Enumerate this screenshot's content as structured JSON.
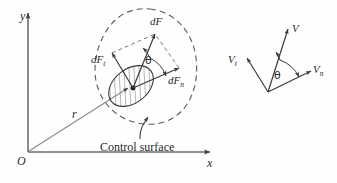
{
  "figure": {
    "name": "control-surface-force-and-velocity-decomposition",
    "background_color": "#fefefe",
    "ink_color": "#3a3a3a",
    "text_color": "#2b2b2b"
  },
  "axes": {
    "y_label": "y",
    "x_label": "x",
    "origin_label": "O",
    "position_vector_label": "r"
  },
  "control_volume": {
    "boundary_style": "dashed",
    "annotation": "Control surface",
    "area_element": "hatched-differential-area"
  },
  "force_diagram": {
    "resultant_label": "dF",
    "tangential_label": "dF",
    "tangential_sub": "t",
    "normal_label": "dF",
    "normal_sub": "n",
    "angle_label": "θ"
  },
  "velocity_diagram": {
    "resultant_label": "V",
    "tangential_label": "V",
    "tangential_sub": "t",
    "normal_label": "V",
    "normal_sub": "n",
    "angle_label": "θ"
  }
}
